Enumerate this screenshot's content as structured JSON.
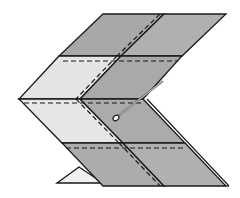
{
  "diagram": {
    "type": "folding-instruction",
    "colors": {
      "background": "#ffffff",
      "dark_panel": "#a9a9a9",
      "mid_panel": "#b4b4b4",
      "light_panel": "#e6e6e6",
      "white_triangle": "#f2f2f2",
      "outline": "#1a1a1a",
      "pin": "#7a7a7a"
    },
    "elements": {
      "top_panels": "upper chevron arm (two shaded quadrants)",
      "middle_panels": "center band (light left, dark right)",
      "bottom_panels": "lower chevron arm (two shaded quadrants)",
      "fold_lines": "dashed lines indicating fold",
      "pin_icon": "needle with eye loop",
      "corner_triangle": "small light triangle at bottom left"
    }
  }
}
